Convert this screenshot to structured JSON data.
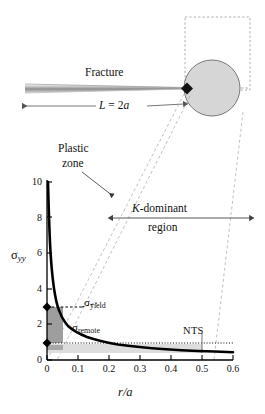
{
  "figure": {
    "schematic": {
      "fracture_label": "Fracture",
      "length_label": "L = 2a",
      "length_label_parts": {
        "symbol": "L",
        "equals": " = 2",
        "half_length": "a"
      },
      "crack_tip_marker": "diamond",
      "plastic_zone_circle_color": "#d4d4d4",
      "callout_box": "dashed-rectangle"
    },
    "annotations": {
      "plastic_zone_line1": "Plastic",
      "plastic_zone_line2": "zone",
      "k_dominant_line1_italic": "K",
      "k_dominant_line1_rest": "-dominant",
      "k_dominant_line2": "region",
      "nts": "NTS",
      "sigma_yield_base": "σ",
      "sigma_yield_sub": "yield",
      "sigma_remote_base": "σ",
      "sigma_remote_sub": "remote"
    }
  },
  "chart_data": {
    "type": "line",
    "title": "",
    "xlabel": "r/a",
    "xlabel_parts": {
      "numerator": "r",
      "slash": "/",
      "denominator": "a"
    },
    "ylabel": "σyy",
    "ylabel_base": "σ",
    "ylabel_sub": "yy",
    "xlim": [
      0,
      0.6
    ],
    "ylim": [
      0,
      10
    ],
    "xticks": [
      "0",
      "0.1",
      "0.2",
      "0.3",
      "0.4",
      "0.5",
      "0.6"
    ],
    "xtick_values": [
      0,
      0.1,
      0.2,
      0.3,
      0.4,
      0.5,
      0.6
    ],
    "yticks": [
      "0",
      "2",
      "4",
      "6",
      "8",
      "10"
    ],
    "ytick_values": [
      0,
      2,
      4,
      6,
      8,
      10
    ],
    "grid": false,
    "legend": null,
    "series": [
      {
        "name": "sigma_yy crack-tip field",
        "description": "inverse square-root singular stress ahead of crack tip",
        "x": [
          0.003,
          0.005,
          0.008,
          0.012,
          0.018,
          0.025,
          0.035,
          0.05,
          0.07,
          0.09,
          0.12,
          0.15,
          0.2,
          0.25,
          0.3,
          0.35,
          0.4,
          0.45,
          0.5,
          0.55,
          0.6
        ],
        "y": [
          10.0,
          8.3,
          6.8,
          5.7,
          4.75,
          4.1,
          3.55,
          3.0,
          2.63,
          2.37,
          2.12,
          1.95,
          1.74,
          1.6,
          1.52,
          1.45,
          1.39,
          1.34,
          1.3,
          1.27,
          1.24
        ]
      }
    ],
    "reference_lines": [
      {
        "name": "sigma_yield",
        "type": "horizontal-dashed",
        "y": 3.0,
        "x_from": 0.0,
        "x_to": 0.052
      },
      {
        "name": "sigma_remote",
        "type": "horizontal-dotted",
        "y": 1.0,
        "x_from": 0.0,
        "x_to": 0.6
      },
      {
        "name": "nts_marker",
        "type": "vertical",
        "x": 0.5,
        "y_from": 0.55,
        "y_to": 1.75
      }
    ],
    "markers": [
      {
        "name": "sigma_yield-point",
        "x": 0.0,
        "y": 3.0,
        "shape": "diamond",
        "color": "#000000"
      },
      {
        "name": "sigma_remote-point",
        "x": 0.0,
        "y": 1.0,
        "shape": "diamond",
        "color": "#000000"
      }
    ],
    "shaded_regions": [
      {
        "name": "plastic-zone-block",
        "x_from": 0.0,
        "x_to": 0.052,
        "y_from": 1.0,
        "y_to": 3.0,
        "color": "#9e9e9e"
      },
      {
        "name": "remote-stress-band",
        "x_from": 0.0,
        "x_to": 0.5,
        "y_from": 0.45,
        "y_to": 0.95,
        "color": "#dddddd"
      },
      {
        "name": "plastic-zone-bar",
        "x_from": 0.0,
        "x_to": 0.052,
        "y_from": 0.55,
        "y_to": 0.82,
        "color": "#a8a8a8"
      }
    ],
    "k_dominant_arrow": {
      "x_from": 0.1,
      "x_to": 0.58,
      "y": 6.6
    }
  },
  "colors": {
    "axis": "#000000",
    "curve": "#000000",
    "plastic_block": "#9e9e9e",
    "remote_band": "#dddddd",
    "circle_fill": "#d6d6d6",
    "circle_stroke": "#777777",
    "dashed_guide": "#999999"
  }
}
